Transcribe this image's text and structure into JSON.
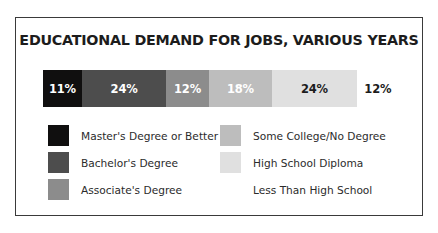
{
  "card": {
    "title": "EDUCATIONAL DEMAND FOR JOBS, VARIOUS YEARS",
    "border_color": "#3a3a3a",
    "background": "#ffffff"
  },
  "chart_data": {
    "type": "bar",
    "orientation": "horizontal-stacked",
    "title": "EDUCATIONAL DEMAND FOR JOBS, VARIOUS YEARS",
    "xlabel": "",
    "ylabel": "",
    "grid": false,
    "legend_position": "bottom",
    "total": 101,
    "categories": [
      "Master's Degree or Better",
      "Bachelor's Degree",
      "Associate's Degree",
      "Some College/No Degree",
      "High School Diploma",
      "Less Than High School"
    ],
    "values": [
      11,
      24,
      12,
      18,
      24,
      12
    ],
    "data_labels": [
      "11%",
      "24%",
      "12%",
      "18%",
      "24%",
      "12%"
    ],
    "colors": [
      "#100f0f",
      "#4d4d4d",
      "#8c8c8c",
      "#bdbdbd",
      "#e0e0e0",
      "#ffffff"
    ],
    "label_colors": [
      "#ffffff",
      "#ffffff",
      "#ffffff",
      "#ffffff",
      "#1c1c1c",
      "#1c1c1c"
    ],
    "segments": [
      {
        "label": "11%",
        "value": 11,
        "category": "Master's Degree or Better",
        "color": "#100f0f",
        "label_color": "#ffffff"
      },
      {
        "label": "24%",
        "value": 24,
        "category": "Bachelor's Degree",
        "color": "#4d4d4d",
        "label_color": "#ffffff"
      },
      {
        "label": "12%",
        "value": 12,
        "category": "Associate's Degree",
        "color": "#8c8c8c",
        "label_color": "#ffffff"
      },
      {
        "label": "18%",
        "value": 18,
        "category": "Some College/No Degree",
        "color": "#bdbdbd",
        "label_color": "#ffffff"
      },
      {
        "label": "24%",
        "value": 24,
        "category": "High School Diploma",
        "color": "#e0e0e0",
        "label_color": "#1c1c1c"
      },
      {
        "label": "12%",
        "value": 12,
        "category": "Less Than High School",
        "color": "#ffffff",
        "label_color": "#1c1c1c"
      }
    ]
  },
  "legend": {
    "left_column": [
      {
        "label": "Master's Degree or Better",
        "color": "#100f0f"
      },
      {
        "label": "Bachelor's Degree",
        "color": "#4d4d4d"
      },
      {
        "label": "Associate's Degree",
        "color": "#8c8c8c"
      }
    ],
    "right_column": [
      {
        "label": "Some College/No Degree",
        "color": "#bdbdbd"
      },
      {
        "label": "High School Diploma",
        "color": "#e0e0e0"
      },
      {
        "label": "Less Than High School",
        "color": "#ffffff"
      }
    ]
  }
}
